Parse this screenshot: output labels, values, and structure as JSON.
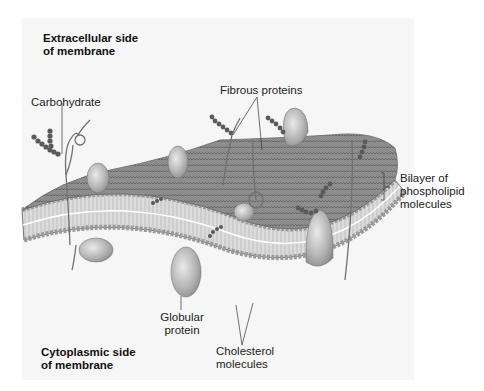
{
  "diagram": {
    "background_panel_color": "#f6f6f6",
    "membrane_color": "#8a8a8a",
    "protein_color": "#b8b8b8",
    "carbohydrate_color": "#555555",
    "side_labels": {
      "top_line1": "Extracellular side",
      "top_line2": "of membrane",
      "bottom_line1": "Cytoplasmic side",
      "bottom_line2": "of membrane"
    },
    "labels": {
      "carbohydrate": "Carbohydrate",
      "fibrous_proteins": "Fibrous proteins",
      "bilayer_line1": "Bilayer of",
      "bilayer_line2": "phospholipid",
      "bilayer_line3": "molecules",
      "globular_line1": "Globular",
      "globular_line2": "protein",
      "cholesterol_line1": "Cholesterol",
      "cholesterol_line2": "molecules"
    }
  }
}
